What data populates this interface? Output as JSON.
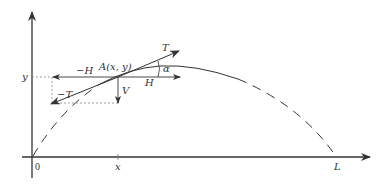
{
  "diagram": {
    "title": "",
    "colors": {
      "stroke": "#333333",
      "dotted": "#777777",
      "background": "#ffffff"
    },
    "axes": {
      "x_axis_labels": {
        "origin": "0",
        "point": "x",
        "end": "L"
      },
      "y_axis_label": "y"
    },
    "point": {
      "label": "A(x, y)"
    },
    "forces": {
      "tension": "T",
      "neg_tension": "−T",
      "horizontal": "H",
      "neg_horizontal": "−H",
      "vertical": "V"
    },
    "angle": {
      "label": "α"
    }
  }
}
